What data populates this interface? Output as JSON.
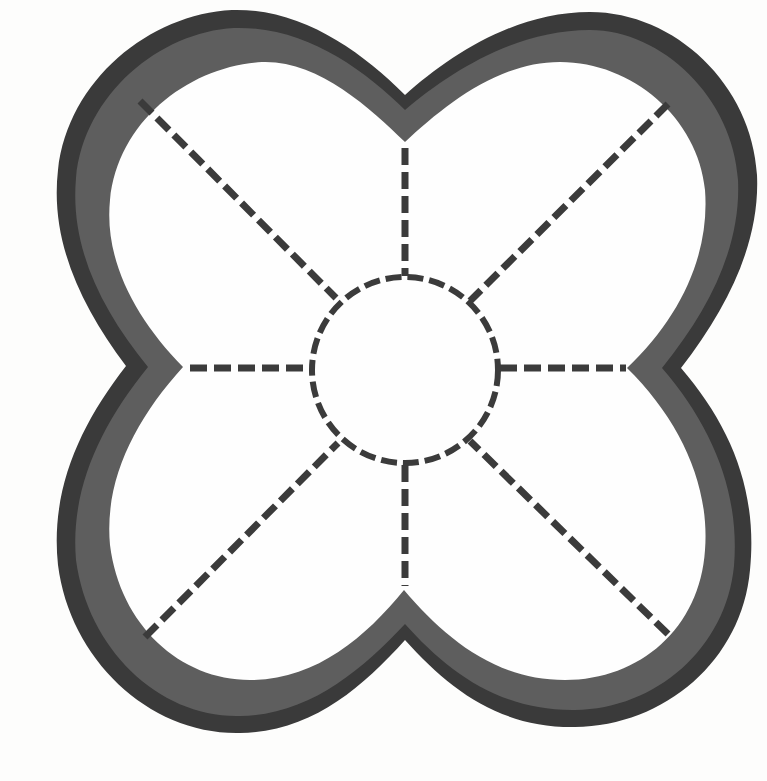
{
  "diagram": {
    "type": "quatrefoil-outline",
    "colors": {
      "background": "#fdfdfc",
      "outer_band": "#3a3a3a",
      "inner_band": "#5e5e5e",
      "interior": "#fefefe",
      "dash": "#3b3b3b"
    },
    "center_circle": {
      "cx": 405,
      "cy": 370,
      "r": 93,
      "style": "dashed"
    },
    "radial_lines": [
      {
        "id": "north",
        "x1": 405,
        "y1": 148,
        "x2": 405,
        "y2": 276
      },
      {
        "id": "south",
        "x1": 405,
        "y1": 465,
        "x2": 405,
        "y2": 586
      },
      {
        "id": "west",
        "x1": 190,
        "y1": 368,
        "x2": 311,
        "y2": 368
      },
      {
        "id": "east",
        "x1": 500,
        "y1": 368,
        "x2": 626,
        "y2": 368
      },
      {
        "id": "north-west",
        "x1": 140,
        "y1": 101,
        "x2": 336,
        "y2": 298
      },
      {
        "id": "north-east",
        "x1": 668,
        "y1": 104,
        "x2": 470,
        "y2": 301
      },
      {
        "id": "south-west",
        "x1": 145,
        "y1": 637,
        "x2": 338,
        "y2": 443
      },
      {
        "id": "south-east",
        "x1": 668,
        "y1": 634,
        "x2": 470,
        "y2": 441
      }
    ],
    "lobes": [
      "top-left",
      "top-right",
      "bottom-left",
      "bottom-right"
    ],
    "notches": {
      "top": {
        "outer": [
          405,
          95
        ],
        "inner": [
          405,
          142
        ]
      },
      "bottom": {
        "outer": [
          405,
          640
        ],
        "inner": [
          404,
          590
        ]
      },
      "left": {
        "outer": [
          126,
          366
        ],
        "inner": [
          183,
          367
        ]
      },
      "right": {
        "outer": [
          681,
          368
        ],
        "inner": [
          627,
          368
        ]
      }
    }
  }
}
